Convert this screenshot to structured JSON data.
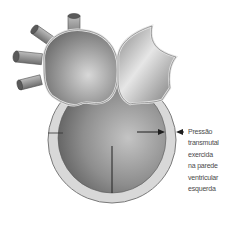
{
  "figure": {
    "annotation": {
      "lines": [
        "Pressão",
        "transmutal",
        "exercida",
        "na parede",
        "ventricular",
        "esquerda"
      ]
    },
    "colors": {
      "background": "#ffffff",
      "wall": "#d6d6d6",
      "wall_outline": "#7a7a7a",
      "cavity_light": "#b8b8b8",
      "cavity_dark": "#6f6f6f",
      "atrium_light": "#c9c9c9",
      "atrium_dark": "#7c7c7c",
      "arrow": "#1e1e1e",
      "text": "#4a4a4a"
    }
  }
}
